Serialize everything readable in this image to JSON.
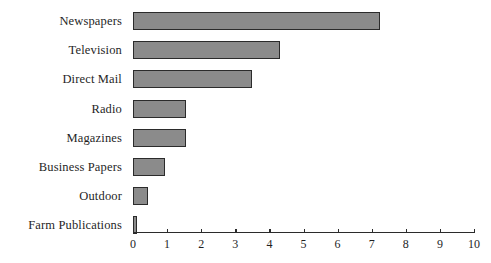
{
  "chart_data": {
    "type": "bar",
    "orientation": "horizontal",
    "title": "",
    "subtitle": "",
    "xlabel": "",
    "ylabel": "",
    "categories": [
      "Newspapers",
      "Television",
      "Direct Mail",
      "Radio",
      "Magazines",
      "Business Papers",
      "Outdoor",
      "Farm Publications"
    ],
    "values": [
      7.25,
      4.3,
      3.5,
      1.55,
      1.55,
      0.95,
      0.45,
      0.1
    ],
    "xlim": [
      0,
      10
    ],
    "xticks": [
      0,
      1,
      2,
      3,
      4,
      5,
      6,
      7,
      8,
      9,
      10
    ],
    "xtick_labels": [
      "0",
      "1",
      "2",
      "3",
      "4",
      "5",
      "6",
      "7",
      "8",
      "9",
      "10"
    ],
    "grid": false,
    "legend": null,
    "bar_fill_color": "#8b8b8b",
    "bar_border_color": "#2b2b2b",
    "axis_color": "#2b2b2b",
    "background_color": "#ffffff"
  }
}
